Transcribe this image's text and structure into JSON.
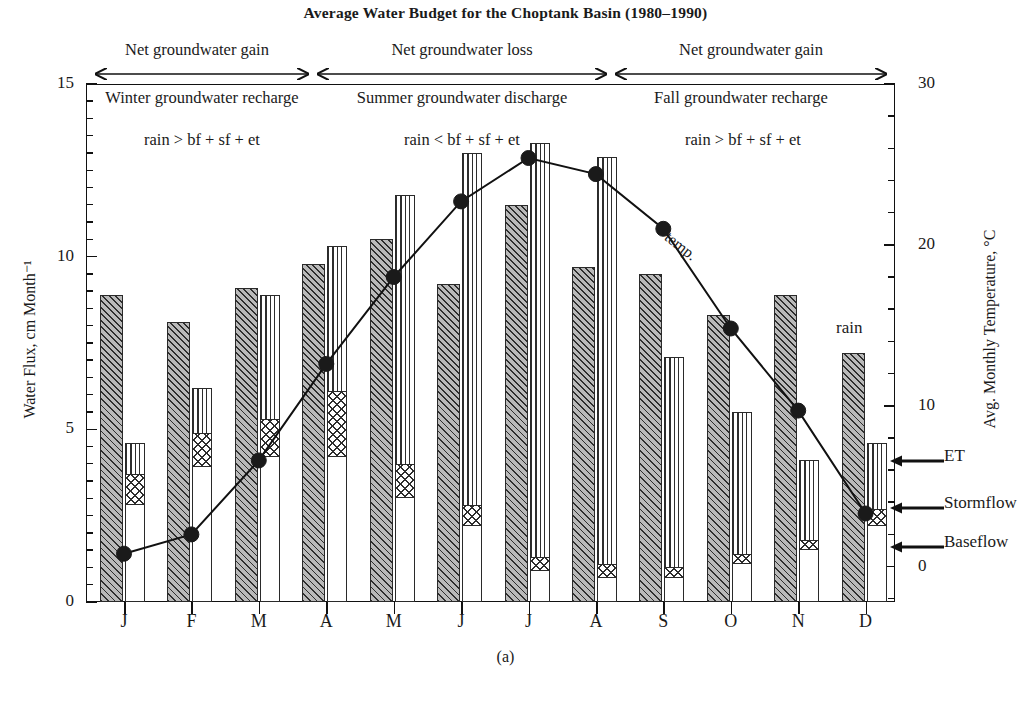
{
  "chart_title": "Average Water Budget for the Choptank Basin (1980–1990)",
  "panel_caption": "(a)",
  "axes": {
    "y_left_title": "Water Flux, cm Month⁻¹",
    "y_right_title": "Avg. Monthly Temperature, °C",
    "y_left_ticks": [
      "0",
      "5",
      "10",
      "15"
    ],
    "y_right_ticks": [
      "0",
      "10",
      "20",
      "30"
    ],
    "y_left_range": [
      0,
      15
    ],
    "y_right_range": [
      -2.2,
      30
    ],
    "x_ticks": [
      "J",
      "F",
      "M",
      "A",
      "M",
      "J",
      "J",
      "A",
      "S",
      "O",
      "N",
      "D"
    ]
  },
  "series_labels": {
    "rain": "rain",
    "temp": "temp.",
    "et": "ET",
    "stormflow": "Stormflow",
    "baseflow": "Baseflow"
  },
  "annotations": {
    "bands": [
      {
        "title": "Net groundwater gain",
        "subtitle": "Winter groundwater recharge",
        "inequality": "rain > bf + sf + et"
      },
      {
        "title": "Net groundwater loss",
        "subtitle": "Summer groundwater discharge",
        "inequality": "rain < bf + sf + et"
      },
      {
        "title": "Net groundwater gain",
        "subtitle": "Fall groundwater recharge",
        "inequality": "rain > bf + sf + et"
      }
    ]
  },
  "chart_data": {
    "type": "bar",
    "title": "Average Water Budget for the Choptank Basin (1980–1990)",
    "xlabel": "",
    "ylabel": "Water Flux, cm Month⁻¹",
    "y2label": "Avg. Monthly Temperature, °C",
    "ylim": [
      0,
      15
    ],
    "y2lim": [
      -2.2,
      30
    ],
    "grid": false,
    "legend": "arrow callouts at right edge",
    "categories": [
      "J",
      "F",
      "M",
      "A",
      "M",
      "J",
      "J",
      "A",
      "S",
      "O",
      "N",
      "D"
    ],
    "series": [
      {
        "name": "rain",
        "type": "bar",
        "units": "cm/month",
        "values": [
          8.9,
          8.1,
          9.1,
          9.8,
          10.5,
          9.2,
          11.5,
          9.7,
          9.5,
          8.3,
          8.9,
          7.2
        ]
      },
      {
        "name": "baseflow",
        "type": "stacked-bar",
        "units": "cm/month",
        "values": [
          2.8,
          3.9,
          4.2,
          4.2,
          3.0,
          2.2,
          0.9,
          0.7,
          0.7,
          1.1,
          1.5,
          2.2
        ]
      },
      {
        "name": "stormflow",
        "type": "stacked-bar",
        "units": "cm/month",
        "values": [
          0.9,
          1.0,
          1.1,
          1.9,
          1.0,
          0.6,
          0.4,
          0.4,
          0.3,
          0.3,
          0.3,
          0.5
        ]
      },
      {
        "name": "et",
        "type": "stacked-bar",
        "units": "cm/month",
        "values": [
          0.9,
          1.3,
          3.6,
          4.2,
          7.8,
          10.2,
          12.0,
          11.8,
          6.1,
          4.1,
          2.3,
          1.9
        ]
      },
      {
        "name": "temp.",
        "type": "line",
        "units": "degC",
        "values": [
          0.8,
          2.0,
          6.6,
          12.6,
          18.0,
          22.7,
          25.4,
          24.4,
          21.0,
          14.8,
          9.7,
          3.3
        ]
      }
    ],
    "stacked_totals": [
      4.6,
      6.2,
      8.9,
      10.3,
      11.8,
      13.0,
      13.3,
      12.9,
      7.1,
      5.5,
      4.1,
      4.6
    ]
  }
}
